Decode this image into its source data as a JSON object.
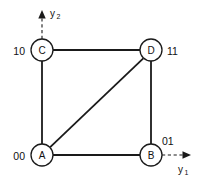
{
  "figure": {
    "type": "graph-diagram",
    "background_color": "#ffffff",
    "stroke_color": "#1a1a1a",
    "width": 200,
    "height": 181
  },
  "axes": {
    "horizontal": {
      "name": "y1",
      "label_base": "y",
      "label_sub": "1",
      "style": "dashed-arrow",
      "direction": "right"
    },
    "vertical": {
      "name": "y2",
      "label_base": "y",
      "label_sub": "2",
      "style": "dashed-arrow",
      "direction": "up"
    }
  },
  "nodes": [
    {
      "id": "C",
      "label": "C",
      "code": "10",
      "code_side": "left",
      "cx": 42,
      "cy": 50,
      "r": 11
    },
    {
      "id": "D",
      "label": "D",
      "code": "11",
      "code_side": "right",
      "cx": 151,
      "cy": 50,
      "r": 11
    },
    {
      "id": "A",
      "label": "A",
      "code": "00",
      "code_side": "left",
      "cx": 42,
      "cy": 155,
      "r": 11
    },
    {
      "id": "B",
      "label": "B",
      "code": "01",
      "code_side": "above-right",
      "cx": 151,
      "cy": 155,
      "r": 11
    }
  ],
  "edges": [
    {
      "from": "C",
      "to": "D",
      "kind": "horizontal-top"
    },
    {
      "from": "A",
      "to": "C",
      "kind": "vertical-left"
    },
    {
      "from": "B",
      "to": "D",
      "kind": "vertical-right"
    },
    {
      "from": "A",
      "to": "B",
      "kind": "horizontal-bottom"
    },
    {
      "from": "A",
      "to": "D",
      "kind": "diagonal"
    }
  ],
  "code_labels": {
    "C": "10",
    "D": "11",
    "A": "00",
    "B": "01"
  },
  "node_labels": {
    "A": "A",
    "B": "B",
    "C": "C",
    "D": "D"
  }
}
